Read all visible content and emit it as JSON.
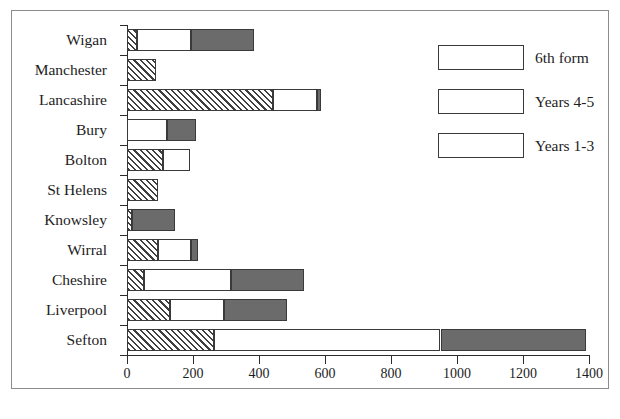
{
  "chart_data": {
    "type": "bar",
    "orientation": "horizontal",
    "stacked": true,
    "title": "",
    "xlabel": "",
    "ylabel": "",
    "xlim": [
      0,
      1400
    ],
    "xticks": [
      0,
      200,
      400,
      600,
      800,
      1000,
      1200,
      1400
    ],
    "xtick_labels": [
      "0",
      "200",
      "400",
      "600",
      "800",
      "1000",
      "1200",
      "1400"
    ],
    "grid": false,
    "legend_position": "upper right",
    "categories": [
      "Wigan",
      "Manchester",
      "Lancashire",
      "Bury",
      "Bolton",
      "St Helens",
      "Knowsley",
      "Wirral",
      "Cheshire",
      "Liverpool",
      "Sefton"
    ],
    "series": [
      {
        "name": "6th form",
        "fill": "diagonal-hatch",
        "values": [
          30,
          88,
          443,
          0,
          110,
          95,
          15,
          95,
          50,
          130,
          265
        ]
      },
      {
        "name": "Years 4-5",
        "fill": "white",
        "values": [
          165,
          0,
          132,
          120,
          80,
          0,
          0,
          100,
          265,
          165,
          685
        ]
      },
      {
        "name": "Years 1-3",
        "fill": "dark-gray",
        "values": [
          190,
          0,
          13,
          88,
          0,
          0,
          130,
          20,
          220,
          190,
          440
        ]
      }
    ],
    "totals": [
      385,
      88,
      588,
      208,
      190,
      95,
      145,
      215,
      535,
      485,
      1390
    ],
    "colors": {
      "hatch": "#3f3f3f",
      "white": "#ffffff",
      "dark": "#6b6b6b",
      "axis": "#2b2b2b",
      "frame": "#8c8c8c",
      "text": "#1d1d1d"
    }
  },
  "legend": {
    "items": [
      {
        "label": "6th form",
        "fill": "diagonal-hatch"
      },
      {
        "label": "Years 4-5",
        "fill": "white"
      },
      {
        "label": "Years 1-3",
        "fill": "dark-gray"
      }
    ]
  }
}
